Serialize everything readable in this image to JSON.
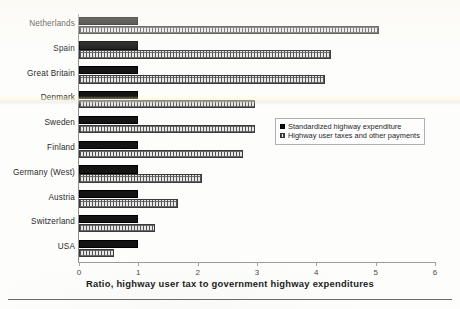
{
  "chart_data": {
    "type": "bar",
    "orientation": "horizontal",
    "title": "",
    "caption": "Ratio, highway user tax to government highway expenditures",
    "xlabel": "Ratio, highway user tax to government highway expenditures",
    "ylabel": "",
    "xlim": [
      0,
      6
    ],
    "xticks": [
      "0",
      "1",
      "2",
      "3",
      "4",
      "5",
      "6"
    ],
    "grid": false,
    "legend_position": "right-middle",
    "categories": [
      "Netherlands",
      "Spain",
      "Great Britain",
      "Denmark",
      "Sweden",
      "Finland",
      "Germany (West)",
      "Austria",
      "Switzerland",
      "USA"
    ],
    "series": [
      {
        "name": "Standardized highway expenditure",
        "fill": "solid-black",
        "color": "#141414",
        "values": [
          1.0,
          1.0,
          1.0,
          1.0,
          1.0,
          1.0,
          1.0,
          1.0,
          1.0,
          1.0
        ]
      },
      {
        "name": "Highway user taxes and other payments",
        "fill": "gray-checkered",
        "color": "#d6d6d6",
        "values": [
          5.05,
          4.25,
          4.15,
          2.97,
          2.97,
          2.77,
          2.08,
          1.67,
          1.28,
          0.59
        ]
      }
    ]
  },
  "legend": {
    "items": [
      {
        "label": "Standardized highway expenditure"
      },
      {
        "label": "Highway user taxes and other payments"
      }
    ]
  },
  "axis": {
    "x_tick_labels": [
      "0",
      "1",
      "2",
      "3",
      "4",
      "5",
      "6"
    ]
  },
  "caption": {
    "text": "Ratio, highway user tax to government highway expenditures"
  }
}
